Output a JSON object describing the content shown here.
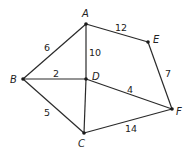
{
  "diagram": {
    "type": "weighted-undirected-graph",
    "nodes": [
      {
        "id": "A",
        "label": "A",
        "x": 86,
        "y": 24,
        "lx": 82,
        "ly": 17
      },
      {
        "id": "B",
        "label": "B",
        "x": 23,
        "y": 79,
        "lx": 10,
        "ly": 83
      },
      {
        "id": "C",
        "label": "C",
        "x": 84,
        "y": 133,
        "lx": 78,
        "ly": 147
      },
      {
        "id": "D",
        "label": "D",
        "x": 86,
        "y": 79,
        "lx": 92,
        "ly": 80
      },
      {
        "id": "E",
        "label": "E",
        "x": 148,
        "y": 42,
        "lx": 153,
        "ly": 43
      },
      {
        "id": "F",
        "label": "F",
        "x": 172,
        "y": 109,
        "lx": 176,
        "ly": 115
      }
    ],
    "edges": [
      {
        "from": "A",
        "to": "B",
        "weight": "6",
        "lx": 44,
        "ly": 51
      },
      {
        "from": "A",
        "to": "D",
        "weight": "10",
        "lx": 89,
        "ly": 56
      },
      {
        "from": "A",
        "to": "E",
        "weight": "12",
        "lx": 115,
        "ly": 31
      },
      {
        "from": "B",
        "to": "D",
        "weight": "2",
        "lx": 53,
        "ly": 77
      },
      {
        "from": "B",
        "to": "C",
        "weight": "5",
        "lx": 44,
        "ly": 116
      },
      {
        "from": "D",
        "to": "C",
        "weight": "",
        "lx": 0,
        "ly": 0
      },
      {
        "from": "D",
        "to": "F",
        "weight": "4",
        "lx": 127,
        "ly": 93
      },
      {
        "from": "E",
        "to": "F",
        "weight": "7",
        "lx": 165,
        "ly": 77
      },
      {
        "from": "C",
        "to": "F",
        "weight": "14",
        "lx": 125,
        "ly": 132
      }
    ]
  }
}
